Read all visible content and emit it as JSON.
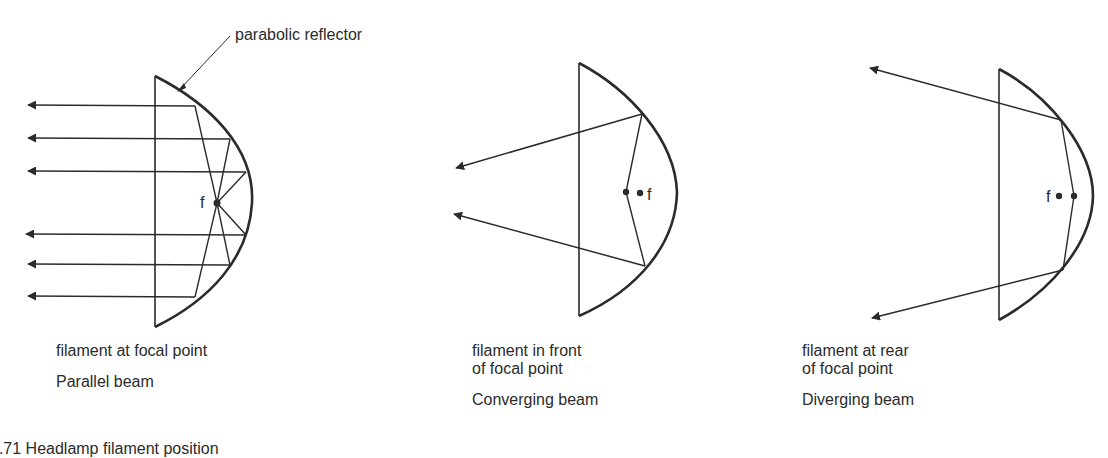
{
  "figure": {
    "callout": "parabolic reflector",
    "focal_symbol": "f",
    "partial_caption": "5.71 Headlamp filament position",
    "panels": [
      {
        "id": "parallel",
        "description": "filament at focal point",
        "beam": "Parallel beam"
      },
      {
        "id": "converging",
        "description_line1": "filament in front",
        "description_line2": "of focal point",
        "beam": "Converging beam"
      },
      {
        "id": "diverging",
        "description_line1": "filament at rear",
        "description_line2": "of focal point",
        "beam": "Diverging beam"
      }
    ],
    "colors": {
      "ink": "#2b2b2b",
      "background": "#ffffff"
    }
  }
}
